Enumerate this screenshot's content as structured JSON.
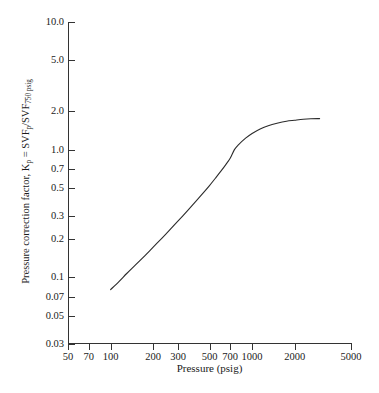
{
  "chart_data": {
    "type": "line",
    "title": "",
    "xlabel": "Pressure (psig)",
    "ylabel_plain": "Pressure correction factor, Kp = SVFp/SVF750 psig",
    "ylabel_parts": {
      "prefix": "Pressure correction factor, K",
      "sub1": "p",
      "mid": " = SVF",
      "sub2": "p",
      "slash": "/SVF",
      "sub3": "750 psig"
    },
    "xscale": "log",
    "yscale": "log",
    "xlim": [
      50,
      5000
    ],
    "ylim": [
      0.03,
      10.0
    ],
    "grid": false,
    "legend": "none",
    "xticks": [
      50,
      70,
      100,
      200,
      300,
      500,
      700,
      1000,
      2000,
      5000
    ],
    "xtick_labels": [
      "50",
      "70",
      "100",
      "200",
      "300",
      "500",
      "700",
      "1000",
      "2000",
      "5000"
    ],
    "yticks": [
      0.03,
      0.05,
      0.07,
      0.1,
      0.2,
      0.3,
      0.5,
      0.7,
      1.0,
      2.0,
      5.0,
      10.0
    ],
    "ytick_labels": [
      "0.03",
      "0.05",
      "0.07",
      "0.1",
      "0.2",
      "0.3",
      "0.5",
      "0.7",
      "1.0",
      "2.0",
      "5.0",
      "10.0"
    ],
    "series": [
      {
        "name": "Pressure correction factor",
        "color": "#2b2b2b",
        "x": [
          100,
          115,
          130,
          150,
          175,
          200,
          230,
          260,
          300,
          350,
          400,
          450,
          500,
          550,
          600,
          650,
          700,
          750,
          800,
          900,
          1000,
          1150,
          1300,
          1500,
          1750,
          2000,
          2300,
          2600,
          3000
        ],
        "y": [
          0.08,
          0.093,
          0.107,
          0.125,
          0.148,
          0.172,
          0.202,
          0.233,
          0.276,
          0.333,
          0.393,
          0.456,
          0.523,
          0.597,
          0.675,
          0.76,
          0.855,
          1.0,
          1.09,
          1.23,
          1.34,
          1.46,
          1.54,
          1.61,
          1.67,
          1.7,
          1.73,
          1.745,
          1.75
        ]
      }
    ]
  }
}
